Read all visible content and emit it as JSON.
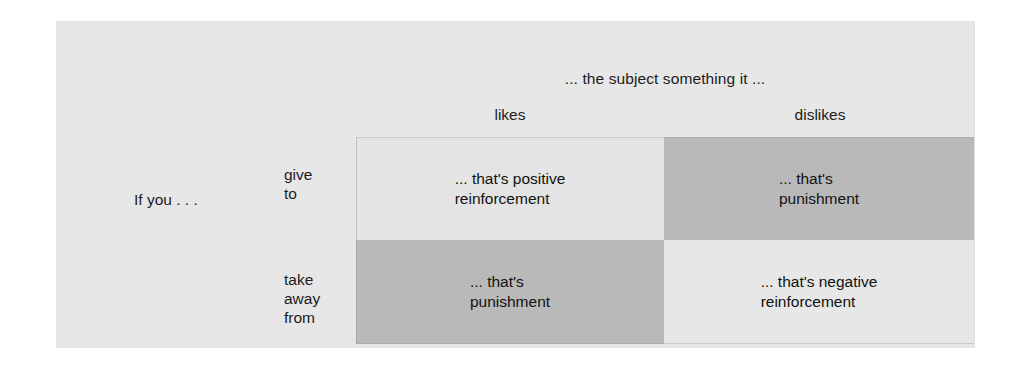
{
  "figure": {
    "background_color": "#e9e9e9",
    "shade_light_color": "#e4e4e4",
    "shade_dark_color": "#b9b9b9",
    "shade_none_color": "#e7e7e7",
    "text_color": "#1c1c1c"
  },
  "column_group_header": "... the subject something it ...",
  "row_group_header": "If you . . .",
  "columns": [
    {
      "label": "likes"
    },
    {
      "label": "dislikes"
    }
  ],
  "rows": [
    {
      "lines": [
        "give",
        "to"
      ]
    },
    {
      "lines": [
        "take",
        "away",
        "from"
      ]
    }
  ],
  "cells": [
    {
      "row": 0,
      "column": 0,
      "text": "... that's positive\nreinforcement",
      "shade": "light"
    },
    {
      "row": 0,
      "column": 1,
      "text": "... that's\npunishment",
      "shade": "dark"
    },
    {
      "row": 1,
      "column": 0,
      "text": "... that's\npunishment",
      "shade": "dark"
    },
    {
      "row": 1,
      "column": 1,
      "text": "... that's negative\nreinforcement",
      "shade": "none"
    }
  ]
}
